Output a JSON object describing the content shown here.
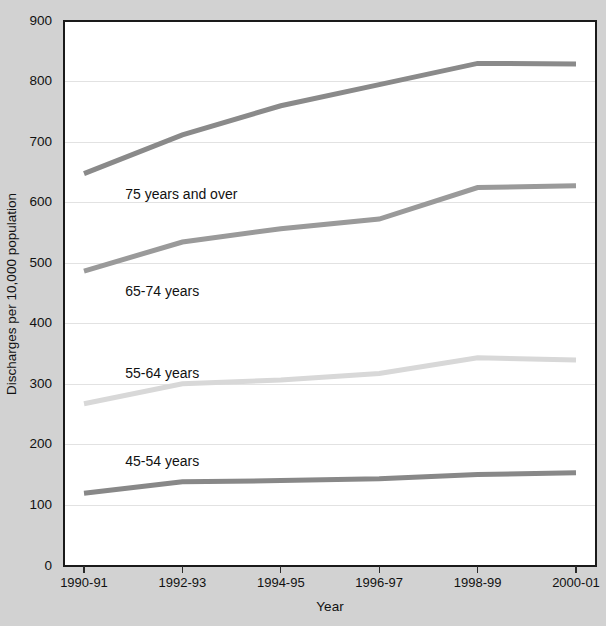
{
  "chart_data": {
    "type": "line",
    "title": "",
    "xlabel": "Year",
    "ylabel": "Discharges per 10,000 population",
    "categories": [
      "1990-91",
      "1992-93",
      "1994-95",
      "1996-97",
      "1998-99",
      "2000-01"
    ],
    "ylim": [
      0,
      900
    ],
    "yticks": [
      0,
      100,
      200,
      300,
      400,
      500,
      600,
      700,
      800,
      900
    ],
    "ytick_labels": [
      "0",
      "100",
      "200",
      "300",
      "400",
      "500",
      "600",
      "700",
      "800",
      "900"
    ],
    "grid": "horizontal",
    "legend_position": "inline-labels",
    "series": [
      {
        "name": "75 years and over",
        "values": [
          648,
          712,
          760,
          795,
          830,
          829
        ],
        "color": "#8a8a8a",
        "label_anchor": {
          "x": 1990.9,
          "y": 612
        }
      },
      {
        "name": "65-74 years",
        "values": [
          487,
          535,
          557,
          573,
          625,
          628
        ],
        "color": "#9a9a9a",
        "label_anchor": {
          "x": 1990.9,
          "y": 452
        }
      },
      {
        "name": "55-64 years",
        "values": [
          268,
          301,
          307,
          318,
          344,
          340
        ],
        "color": "#d8d8d8",
        "label_anchor": {
          "x": 1990.9,
          "y": 316
        }
      },
      {
        "name": "45-54 years",
        "values": [
          120,
          139,
          141,
          144,
          151,
          154
        ],
        "color": "#888888",
        "label_anchor": {
          "x": 1990.9,
          "y": 172
        }
      }
    ]
  },
  "figure": {
    "background_color": "#d2d2d2",
    "plot_background_color": "#ffffff",
    "frame_color": "#1a1a1a",
    "gridline_color": "#e2e2e2",
    "text_color": "#111111"
  },
  "axes": {
    "y_axis_title": "Discharges per 10,000 population",
    "x_axis_title": "Year"
  }
}
